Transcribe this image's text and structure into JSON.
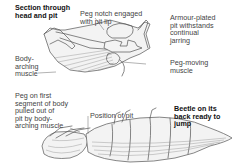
{
  "diagram": {
    "labels": {
      "section_title": "Section through\nhead and pit",
      "peg_notch": "Peg notch engaged\nwith pit lip",
      "armour_pit": "Armour-plated\npit withstands\ncontinual\njarring",
      "body_arching": "Body-\narching\nmuscle",
      "peg_moving": "Peg-moving\nmuscle",
      "peg_first_segment": "Peg on first\nsegment of body\npulled out of\npit by body-\narching muscle",
      "position_of_pit": "Position of pit",
      "beetle_ready": "Beetle on its\nback ready to\njump"
    },
    "illustrations": {
      "top": "head-and-pit-cross-section",
      "bottom": "click-beetle-on-back"
    }
  }
}
